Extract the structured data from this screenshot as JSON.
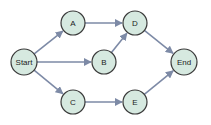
{
  "diagram": {
    "type": "directed-graph",
    "nodes": [
      {
        "id": "Start",
        "label": "Start",
        "x": 24,
        "y": 62
      },
      {
        "id": "A",
        "label": "A",
        "x": 73,
        "y": 23
      },
      {
        "id": "B",
        "label": "B",
        "x": 104,
        "y": 62
      },
      {
        "id": "C",
        "label": "C",
        "x": 73,
        "y": 102
      },
      {
        "id": "D",
        "label": "D",
        "x": 135,
        "y": 23
      },
      {
        "id": "E",
        "label": "E",
        "x": 135,
        "y": 102
      },
      {
        "id": "End",
        "label": "End",
        "x": 184,
        "y": 62
      }
    ],
    "edges": [
      {
        "from": "Start",
        "to": "A"
      },
      {
        "from": "Start",
        "to": "B"
      },
      {
        "from": "Start",
        "to": "C"
      },
      {
        "from": "A",
        "to": "D"
      },
      {
        "from": "B",
        "to": "D"
      },
      {
        "from": "C",
        "to": "E"
      },
      {
        "from": "D",
        "to": "End"
      },
      {
        "from": "E",
        "to": "End"
      }
    ],
    "colors": {
      "node_fill": "#d6e9e0",
      "node_stroke": "#3a3a3a",
      "edge": "#7d8aa6"
    }
  }
}
